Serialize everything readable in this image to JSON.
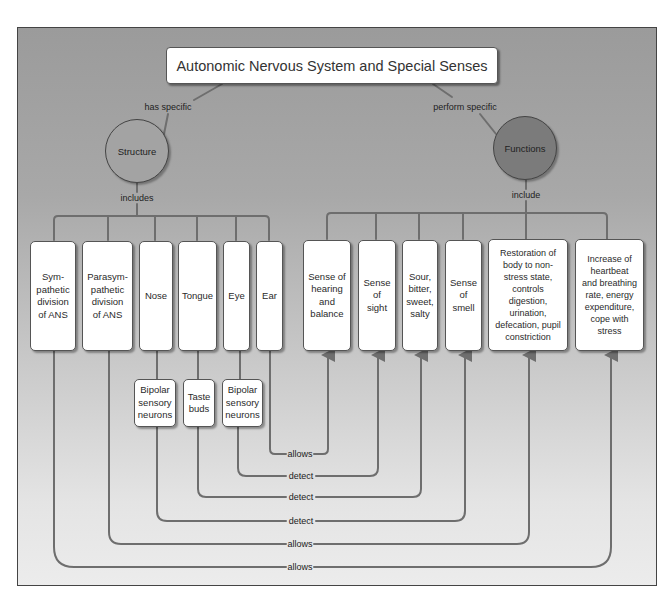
{
  "title": "Autonomic Nervous System and Special Senses",
  "link_labels": {
    "has_specific": "has specific",
    "perform_specific": "perform specific",
    "includes": "includes",
    "include": "include"
  },
  "nodes": {
    "structure": "Structure",
    "functions": "Functions"
  },
  "structures": [
    {
      "id": "sympathetic",
      "label": "Sym-\npathetic\ndivision\nof ANS"
    },
    {
      "id": "parasympathetic",
      "label": "Parasym-\npathetic\ndivision\nof ANS"
    },
    {
      "id": "nose",
      "label": "Nose"
    },
    {
      "id": "tongue",
      "label": "Tongue"
    },
    {
      "id": "eye",
      "label": "Eye"
    },
    {
      "id": "ear",
      "label": "Ear"
    }
  ],
  "sub_structures": [
    {
      "id": "bipolar-nose",
      "label": "Bipolar\nsensory\nneurons"
    },
    {
      "id": "taste-buds",
      "label": "Taste\nbuds"
    },
    {
      "id": "bipolar-eye",
      "label": "Bipolar\nsensory\nneurons"
    }
  ],
  "functions": [
    {
      "id": "hearing",
      "label": "Sense of\nhearing\nand\nbalance"
    },
    {
      "id": "sight",
      "label": "Sense\nof\nsight"
    },
    {
      "id": "taste",
      "label": "Sour,\nbitter,\nsweet,\nsalty"
    },
    {
      "id": "smell",
      "label": "Sense\nof\nsmell"
    },
    {
      "id": "restoration",
      "label": "Restoration of\nbody to non-\nstress state,\ncontrols\ndigestion,\nurination,\ndefecation, pupil\nconstriction"
    },
    {
      "id": "increase",
      "label": "Increase of\nheartbeat\nand breathing\nrate, energy\nexpenditure,\ncope with\nstress"
    }
  ],
  "relations": [
    {
      "from": "Ear",
      "to": "Sense of hearing and balance",
      "label": "allows"
    },
    {
      "from": "Bipolar sensory neurons (Eye)",
      "to": "Sense of sight",
      "label": "detect"
    },
    {
      "from": "Taste buds",
      "to": "Sour, bitter, sweet, salty",
      "label": "detect"
    },
    {
      "from": "Bipolar sensory neurons (Nose)",
      "to": "Sense of smell",
      "label": "detect"
    },
    {
      "from": "Parasympathetic division of ANS",
      "to": "Restoration of body to non-stress state",
      "label": "allows"
    },
    {
      "from": "Sympathetic division of ANS",
      "to": "Increase of heartbeat and breathing rate",
      "label": "allows"
    }
  ],
  "colors": {
    "line": "#6e6e6e",
    "structure_fill": "#a3a3a3",
    "functions_fill": "#7b7b7b",
    "box_fill": "#ffffff"
  }
}
